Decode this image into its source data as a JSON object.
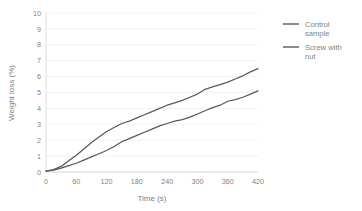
{
  "chart_data": {
    "type": "line",
    "title": "",
    "xlabel": "Time (s)",
    "ylabel": "Weight loss (%)",
    "xlim": [
      0,
      420
    ],
    "ylim": [
      0,
      10
    ],
    "xticks": [
      0,
      60,
      120,
      180,
      240,
      300,
      360,
      420
    ],
    "yticks": [
      0,
      1,
      2,
      3,
      4,
      5,
      6,
      7,
      8,
      9,
      10
    ],
    "grid": "horizontal",
    "legend_position": "right",
    "x": [
      0,
      15,
      30,
      45,
      60,
      75,
      90,
      105,
      120,
      135,
      150,
      165,
      180,
      195,
      210,
      225,
      240,
      255,
      270,
      285,
      300,
      315,
      330,
      345,
      360,
      375,
      390,
      405,
      420
    ],
    "series": [
      {
        "name": "Control sample",
        "color": "#595959",
        "values": [
          0.05,
          0.15,
          0.35,
          0.7,
          1.05,
          1.45,
          1.85,
          2.2,
          2.55,
          2.8,
          3.05,
          3.2,
          3.4,
          3.6,
          3.8,
          4.0,
          4.2,
          4.35,
          4.5,
          4.7,
          4.9,
          5.2,
          5.35,
          5.5,
          5.65,
          5.85,
          6.05,
          6.3,
          6.5
        ]
      },
      {
        "name": "Screw with nut",
        "color": "#595959",
        "values": [
          0.05,
          0.12,
          0.25,
          0.4,
          0.55,
          0.75,
          0.95,
          1.15,
          1.35,
          1.6,
          1.9,
          2.1,
          2.3,
          2.5,
          2.7,
          2.9,
          3.05,
          3.2,
          3.3,
          3.45,
          3.65,
          3.85,
          4.05,
          4.2,
          4.45,
          4.55,
          4.7,
          4.9,
          5.1
        ]
      }
    ]
  },
  "legend": {
    "items": [
      {
        "label_line1": "Control",
        "label_line2": "sample"
      },
      {
        "label_line1": "Screw with",
        "label_line2": "nut"
      }
    ]
  }
}
